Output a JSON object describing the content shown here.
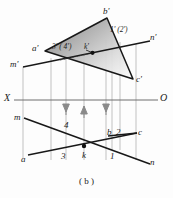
{
  "figure": {
    "caption": "( b )",
    "type": "descriptive-geometry-projection",
    "axis": {
      "left_label": "X",
      "right_label": "O"
    },
    "colors": {
      "line": "#1a1a1a",
      "projector": "#9a9a9a",
      "arrow": "#8a8a8a",
      "shade_dark": "#8f8f8f",
      "shade_light": "#f2f2f2",
      "background": "#fdfdfd"
    },
    "front_view": {
      "name": "vertical-projection",
      "triangle_vertices": [
        {
          "label": "a'",
          "x": 45,
          "y": 51
        },
        {
          "label": "b'",
          "x": 107,
          "y": 18
        },
        {
          "label": "c'",
          "x": 133,
          "y": 79
        }
      ],
      "line_mn": {
        "start_label": "m'",
        "end_label": "n'",
        "x1": 23,
        "y1": 67,
        "x2": 148,
        "y2": 42
      },
      "point_labels": [
        {
          "label": "3' ( 4')",
          "x": 58,
          "y": 47
        },
        {
          "label": "k'",
          "x": 90,
          "y": 46
        },
        {
          "label": "1' (2')",
          "x": 113,
          "y": 31
        }
      ],
      "marked_point": {
        "label": "k'",
        "x": 92,
        "y": 53
      }
    },
    "top_view": {
      "name": "horizontal-projection",
      "triangle_vertices": [
        {
          "label": "a",
          "x": 30,
          "y": 155
        },
        {
          "label": "b",
          "x": 108,
          "y": 135
        },
        {
          "label": "c",
          "x": 137,
          "y": 133
        }
      ],
      "line_mn": {
        "start_label": "m",
        "end_label": "n",
        "x1": 24,
        "y1": 119,
        "x2": 148,
        "y2": 163
      },
      "point_labels": [
        {
          "label": "3",
          "x": 63,
          "y": 156
        },
        {
          "label": "k",
          "x": 85,
          "y": 157
        },
        {
          "label": "1",
          "x": 113,
          "y": 156
        },
        {
          "label": "2",
          "x": 122,
          "y": 134
        },
        {
          "label": "4",
          "x": 66,
          "y": 126
        }
      ],
      "marked_point": {
        "label": "k",
        "x": 84,
        "y": 146
      }
    },
    "projectors": [
      {
        "name": "projector-a",
        "x": 23
      },
      {
        "name": "projector-3",
        "x": 51
      },
      {
        "name": "projector-4",
        "x": 66
      },
      {
        "name": "projector-k",
        "x": 84
      },
      {
        "name": "projector-1",
        "x": 106
      },
      {
        "name": "projector-b",
        "x": 112
      },
      {
        "name": "projector-2",
        "x": 120
      },
      {
        "name": "projector-c",
        "x": 136
      }
    ],
    "arrows": [
      {
        "name": "arrow-down-4",
        "x": 66,
        "direction": "down"
      },
      {
        "name": "arrow-up-k",
        "x": 84,
        "direction": "up"
      },
      {
        "name": "arrow-down-1",
        "x": 106,
        "direction": "down"
      }
    ]
  }
}
